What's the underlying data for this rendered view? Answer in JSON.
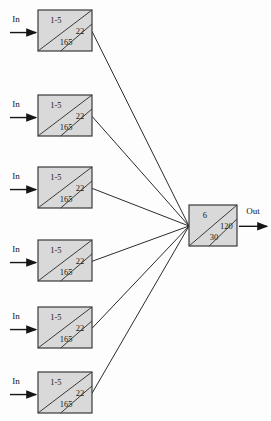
{
  "diagram": {
    "background_color": "#fdfdfd",
    "node_fill_color": "#d9d9d9",
    "node_stroke_color": "#3a3a3a",
    "line_color": "#2b2b2b",
    "text_color": "#1a1a1a",
    "input_label": "In",
    "output_label": "Out",
    "input_nodes": [
      {
        "id": 1,
        "top": "1-5",
        "right": "22",
        "bottom": "165",
        "x": 38,
        "y": 10,
        "w": 54,
        "h": 41
      },
      {
        "id": 2,
        "top": "1-5",
        "right": "22",
        "bottom": "165",
        "x": 38,
        "y": 95,
        "w": 54,
        "h": 41
      },
      {
        "id": 3,
        "top": "1-5",
        "right": "22",
        "bottom": "165",
        "x": 38,
        "y": 167,
        "w": 54,
        "h": 41
      },
      {
        "id": 4,
        "top": "1-5",
        "right": "22",
        "bottom": "165",
        "x": 38,
        "y": 240,
        "w": 54,
        "h": 41
      },
      {
        "id": 5,
        "top": "1-5",
        "right": "22",
        "bottom": "165",
        "x": 38,
        "y": 307,
        "w": 54,
        "h": 41
      },
      {
        "id": 6,
        "top": "1-5",
        "right": "22",
        "bottom": "165",
        "x": 38,
        "y": 372,
        "w": 54,
        "h": 41
      }
    ],
    "output_node": {
      "id": "out",
      "top": "6",
      "right": "120",
      "bottom": "30",
      "x": 189,
      "y": 205,
      "w": 48,
      "h": 41
    },
    "convergence_point": {
      "x": 189,
      "y": 226
    }
  }
}
